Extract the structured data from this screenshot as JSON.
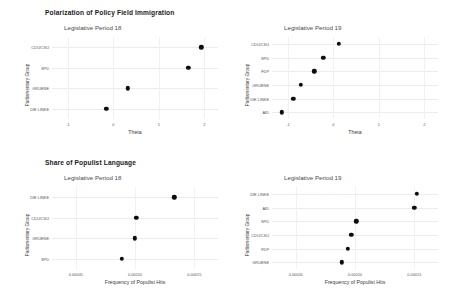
{
  "figures": [
    {
      "title": "Polarization of Policy Field Immigration",
      "panels": [
        {
          "subtitle": "Legislative Period 18",
          "ylabel": "Parliamentary Group",
          "xlabel": "Theta",
          "yticks": [
            "CDU/CSU",
            "SPD",
            "GRUENE",
            "DIE LINKE"
          ],
          "xticks": [
            "-1",
            "0",
            "1",
            "2"
          ]
        },
        {
          "subtitle": "Legislative Period 19",
          "ylabel": "Parliamentary Group",
          "xlabel": "Theta",
          "yticks": [
            "CDU/CSU",
            "SPD",
            "FDP",
            "GRUENE",
            "DIE LINKE",
            "AfD"
          ],
          "xticks": [
            "-1",
            "0",
            "1",
            "2"
          ]
        }
      ]
    },
    {
      "title": "Share of Populist Language",
      "panels": [
        {
          "subtitle": "Legislative Period 18",
          "ylabel": "Parliamentary Group",
          "xlabel": "Frequency of Populist Hits",
          "yticks": [
            "DIE LINKE",
            "CDU/CSU",
            "GRUENE",
            "SPD"
          ],
          "xticks": [
            "0.00005",
            "0.00010",
            "0.00015"
          ]
        },
        {
          "subtitle": "Legislative Period 19",
          "ylabel": "Parliamentary Group",
          "xlabel": "Frequency of Populist Hits",
          "yticks": [
            "DIE LINKE",
            "AfD",
            "SPD",
            "CDU/CSU",
            "FDP",
            "GRUENE"
          ],
          "xticks": [
            "0.00005",
            "0.00010",
            "0.00015"
          ]
        }
      ]
    }
  ],
  "chart_data": [
    {
      "type": "scatter",
      "title": "Polarization of Policy Field Immigration",
      "subtitle": "Legislative Period 18",
      "xlabel": "Theta",
      "ylabel": "Parliamentary Group",
      "categories": [
        "CDU/CSU",
        "SPD",
        "GRUENE",
        "DIE LINKE"
      ],
      "values": [
        1.93,
        1.65,
        0.32,
        -0.16
      ],
      "xlim": [
        -1.35,
        2.3
      ],
      "xticks": [
        -1,
        0,
        1,
        2
      ],
      "grid": true,
      "dot_color": "#0d0d0d"
    },
    {
      "type": "scatter",
      "title": "Polarization of Policy Field Immigration",
      "subtitle": "Legislative Period 19",
      "xlabel": "Theta",
      "ylabel": "Parliamentary Group",
      "categories": [
        "CDU/CSU",
        "SPD",
        "FDP",
        "GRUENE",
        "DIE LINKE",
        "AfD"
      ],
      "values": [
        0.12,
        -0.22,
        -0.42,
        -0.72,
        -0.88,
        -1.13
      ],
      "xlim": [
        -1.35,
        2.3
      ],
      "xticks": [
        -1,
        0,
        1,
        2
      ],
      "grid": true,
      "dot_color": "#0d0d0d"
    },
    {
      "type": "scatter",
      "title": "Share of Populist Language",
      "subtitle": "Legislative Period 18",
      "xlabel": "Frequency of Populist Hits",
      "ylabel": "Parliamentary Group",
      "categories": [
        "DIE LINKE",
        "CDU/CSU",
        "GRUENE",
        "SPD"
      ],
      "values": [
        0.000133,
        0.000101,
        0.0001,
        8.9e-05
      ],
      "xlim": [
        3e-05,
        0.00017
      ],
      "xticks": [
        5e-05,
        0.0001,
        0.00015
      ],
      "grid": true,
      "dot_color": "#0d0d0d"
    },
    {
      "type": "scatter",
      "title": "Share of Populist Language",
      "subtitle": "Legislative Period 19",
      "xlabel": "Frequency of Populist Hits",
      "ylabel": "Parliamentary Group",
      "categories": [
        "DIE LINKE",
        "AfD",
        "SPD",
        "CDU/CSU",
        "FDP",
        "GRUENE"
      ],
      "values": [
        0.000152,
        0.00015,
        0.000101,
        9.7e-05,
        9.4e-05,
        8.9e-05
      ],
      "xlim": [
        3e-05,
        0.00017
      ],
      "xticks": [
        5e-05,
        0.0001,
        0.00015
      ],
      "grid": true,
      "dot_color": "#0d0d0d"
    }
  ]
}
